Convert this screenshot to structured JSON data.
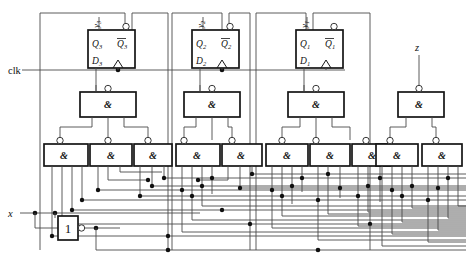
{
  "diagram": {
    "type": "digital-logic-schematic",
    "colors": {
      "wire": "#4a4a4a",
      "box_stroke": "#141414",
      "background": "#ffffff",
      "junction": "#101010"
    }
  },
  "io": {
    "clk": "clk",
    "x": "x",
    "z": "z"
  },
  "flipflops": [
    {
      "id": "ff3",
      "q": "Q",
      "q_sub": "3",
      "qbar": "Q",
      "qbar_sub": "3",
      "d": "D",
      "d_sub": "3",
      "state_label": "y",
      "state_sub": "3"
    },
    {
      "id": "ff2",
      "q": "Q",
      "q_sub": "2",
      "qbar": "Q",
      "qbar_sub": "2",
      "d": "D",
      "d_sub": "2",
      "state_label": "y",
      "state_sub": "2"
    },
    {
      "id": "ff1",
      "q": "Q",
      "q_sub": "1",
      "qbar": "Q",
      "qbar_sub": "1",
      "d": "D",
      "d_sub": "1",
      "state_label": "y",
      "state_sub": "1"
    }
  ],
  "gates": {
    "nand_symbol": "&",
    "inverter_symbol": "1",
    "upper_nand_count": 4,
    "lower_nand_count": 10,
    "inverter_count": 1
  },
  "nand_gates_upper": [
    {
      "id": "u1",
      "symbol": "&"
    },
    {
      "id": "u2",
      "symbol": "&"
    },
    {
      "id": "u3",
      "symbol": "&"
    },
    {
      "id": "u4",
      "symbol": "&"
    }
  ],
  "nand_gates_lower": [
    {
      "id": "l1",
      "symbol": "&"
    },
    {
      "id": "l2",
      "symbol": "&"
    },
    {
      "id": "l3",
      "symbol": "&"
    },
    {
      "id": "l4",
      "symbol": "&"
    },
    {
      "id": "l5",
      "symbol": "&"
    },
    {
      "id": "l6",
      "symbol": "&"
    },
    {
      "id": "l7",
      "symbol": "&"
    },
    {
      "id": "l8",
      "symbol": "&"
    },
    {
      "id": "l9",
      "symbol": "&"
    },
    {
      "id": "l10",
      "symbol": "&"
    }
  ],
  "inverter": {
    "id": "inv1",
    "symbol": "1"
  }
}
